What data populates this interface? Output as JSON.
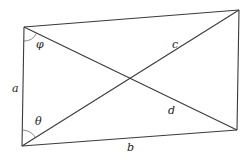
{
  "diagram": {
    "type": "quadrilateral-with-diagonals",
    "vertices": {
      "top_left": [
        24,
        27
      ],
      "top_right": [
        239,
        10
      ],
      "bottom_right": [
        237,
        130
      ],
      "bottom_left": [
        22,
        146
      ]
    },
    "labels": {
      "side_a": "a",
      "side_b": "b",
      "diagonal_c": "c",
      "diagonal_d": "d",
      "angle_top": "φ",
      "angle_bottom": "θ"
    },
    "colors": {
      "line": "#3a3a3a",
      "text": "#222222",
      "background": "#ffffff"
    }
  }
}
